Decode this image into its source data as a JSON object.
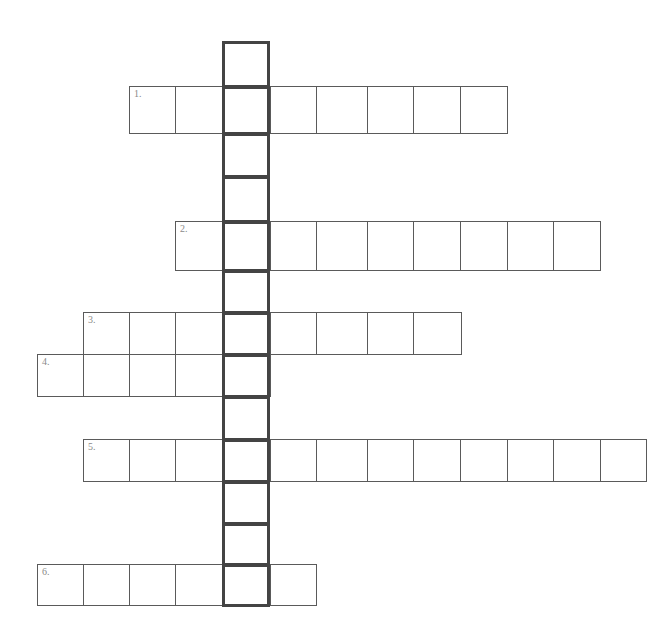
{
  "puzzle": {
    "type": "crossword",
    "mystery_column": {
      "x": 222,
      "width": 48,
      "cell_borders_y": [
        41,
        86,
        133,
        176,
        221,
        270,
        312,
        354,
        396,
        439,
        481,
        523,
        564,
        605
      ],
      "length": 13
    },
    "rows": [
      {
        "label": "1.",
        "top": 86,
        "bottom": 133,
        "borders_x": [
          129,
          175,
          222,
          270,
          316,
          367,
          413,
          460,
          507
        ]
      },
      {
        "label": "2.",
        "top": 221,
        "bottom": 270,
        "borders_x": [
          175,
          222,
          270,
          316,
          367,
          413,
          460,
          507,
          553,
          600
        ]
      },
      {
        "label": "3.",
        "top": 312,
        "bottom": 354,
        "borders_x": [
          83,
          129,
          175,
          222,
          270,
          316,
          367,
          413,
          461
        ]
      },
      {
        "label": "4.",
        "top": 354,
        "bottom": 396,
        "borders_x": [
          37,
          83,
          129,
          175,
          222,
          270
        ]
      },
      {
        "label": "5.",
        "top": 439,
        "bottom": 481,
        "borders_x": [
          83,
          129,
          175,
          222,
          270,
          316,
          367,
          413,
          460,
          507,
          553,
          600,
          646
        ]
      },
      {
        "label": "6.",
        "top": 564,
        "bottom": 605,
        "borders_x": [
          37,
          83,
          129,
          175,
          222,
          270,
          316
        ]
      }
    ],
    "colors": {
      "cell_border": "#5a5a5a",
      "column_border": "#444444",
      "label": "#8a8a8a",
      "background": "#ffffff"
    }
  }
}
